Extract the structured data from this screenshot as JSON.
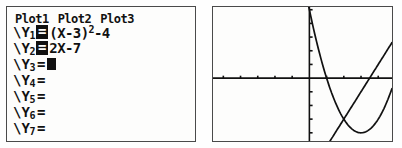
{
  "device": "graphing-calculator",
  "yeditor": {
    "plots": [
      {
        "label": "Plot1",
        "state": "off"
      },
      {
        "label": "Plot2",
        "state": "off"
      },
      {
        "label": "Plot3",
        "state": "off"
      }
    ],
    "functions": [
      {
        "name": "Y",
        "index": "1",
        "prefix": "\\",
        "equals": "=",
        "selected": true,
        "expression": "(X-3)",
        "exponent": "2",
        "expression_tail": "-4",
        "cursor": false
      },
      {
        "name": "Y",
        "index": "2",
        "prefix": "\\",
        "equals": "=",
        "selected": true,
        "expression": "2X-7",
        "exponent": "",
        "expression_tail": "",
        "cursor": false
      },
      {
        "name": "Y",
        "index": "3",
        "prefix": "\\",
        "equals": "=",
        "selected": false,
        "expression": "",
        "exponent": "",
        "expression_tail": "",
        "cursor": true
      },
      {
        "name": "Y",
        "index": "4",
        "prefix": "\\",
        "equals": "=",
        "selected": false,
        "expression": "",
        "exponent": "",
        "expression_tail": "",
        "cursor": false
      },
      {
        "name": "Y",
        "index": "5",
        "prefix": "\\",
        "equals": "=",
        "selected": false,
        "expression": "",
        "exponent": "",
        "expression_tail": "",
        "cursor": false
      },
      {
        "name": "Y",
        "index": "6",
        "prefix": "\\",
        "equals": "=",
        "selected": false,
        "expression": "",
        "exponent": "",
        "expression_tail": "",
        "cursor": false
      },
      {
        "name": "Y",
        "index": "7",
        "prefix": "\\",
        "equals": "=",
        "selected": false,
        "expression": "",
        "exponent": "",
        "expression_tail": "",
        "cursor": false
      }
    ]
  },
  "chart_data": {
    "type": "line",
    "title": "",
    "xlabel": "",
    "ylabel": "",
    "xlim": [
      -5.6,
      4.8
    ],
    "ylim": [
      -4.6,
      5.2
    ],
    "grid": false,
    "axes": true,
    "tick_marks": true,
    "x_tick_step": 1,
    "y_tick_step": 1,
    "legend": "none",
    "series": [
      {
        "name": "Y1",
        "equation": "(X-3)^2-4",
        "color": "#111111",
        "vertex": [
          3,
          -4
        ],
        "roots": [
          1,
          5
        ],
        "y_intercept": 5
      },
      {
        "name": "Y2",
        "equation": "2X-7",
        "color": "#111111",
        "slope": 2,
        "y_intercept": -7,
        "root": 3.5
      }
    ],
    "intersections": [
      [
        2,
        -3
      ],
      [
        6,
        5
      ]
    ]
  }
}
